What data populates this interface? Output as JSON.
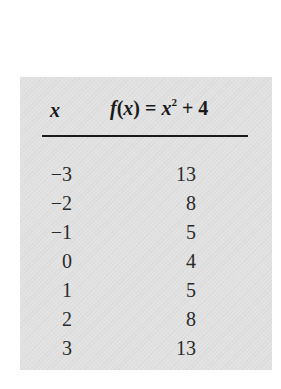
{
  "table": {
    "header": {
      "x_label": "x",
      "fx_prefix": "f",
      "fx_arg": "(",
      "fx_var": "x",
      "fx_close": ") = ",
      "fx_x": "x",
      "fx_exp": "2",
      "fx_tail": " + 4"
    },
    "rows": [
      {
        "x": "−3",
        "fx": "13"
      },
      {
        "x": "−2",
        "fx": "8"
      },
      {
        "x": "−1",
        "fx": "5"
      },
      {
        "x": "0",
        "fx": "4"
      },
      {
        "x": "1",
        "fx": "5"
      },
      {
        "x": "2",
        "fx": "8"
      },
      {
        "x": "3",
        "fx": "13"
      }
    ]
  },
  "colors": {
    "box_background": "#e2e2e2",
    "text": "#2a2a2a",
    "rule": "#1a1a1a"
  }
}
